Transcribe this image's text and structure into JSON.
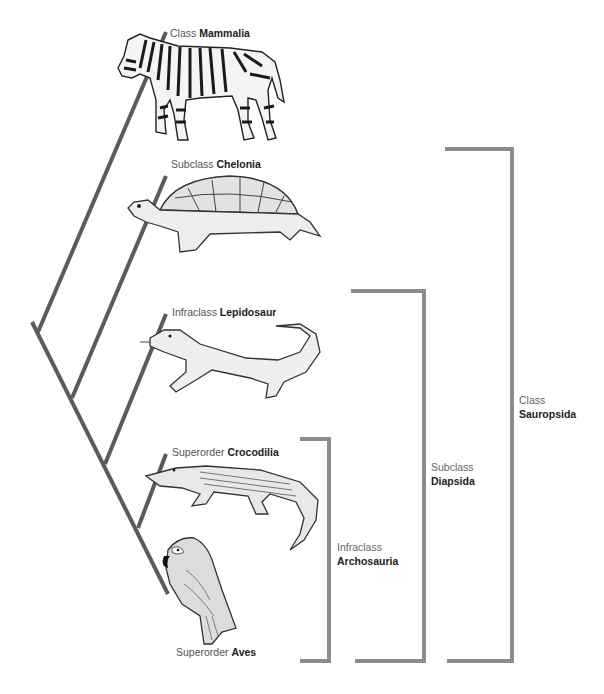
{
  "diagram": {
    "type": "cladogram",
    "colors": {
      "branch": "#5a5a5a",
      "bracket": "#8a8a8a",
      "text": "#555555",
      "text_bold": "#222222"
    },
    "taxa": [
      {
        "rank": "Class",
        "name": "Mammalia",
        "animal": "zebra"
      },
      {
        "rank": "Subclass",
        "name": "Chelonia",
        "animal": "turtle"
      },
      {
        "rank": "Infraclass",
        "name": "Lepidosaur",
        "animal": "lizard"
      },
      {
        "rank": "Superorder",
        "name": "Crocodilia",
        "animal": "crocodile"
      },
      {
        "rank": "Superorder",
        "name": "Aves",
        "animal": "parrot"
      }
    ],
    "groups": [
      {
        "rank": "Infraclass",
        "name": "Archosauria",
        "includes": [
          "Crocodilia",
          "Aves"
        ]
      },
      {
        "rank": "Subclass",
        "name": "Diapsida",
        "includes": [
          "Lepidosaur",
          "Crocodilia",
          "Aves"
        ]
      },
      {
        "rank": "Class",
        "name": "Sauropsida",
        "includes": [
          "Chelonia",
          "Lepidosaur",
          "Crocodilia",
          "Aves"
        ]
      }
    ]
  }
}
